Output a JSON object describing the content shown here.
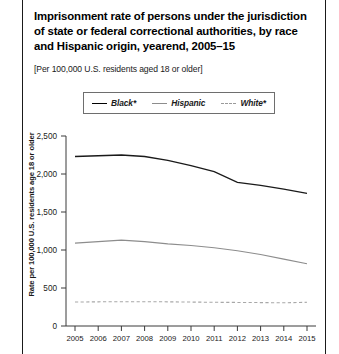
{
  "figure": {
    "title": "Imprisonment rate of persons under the jurisdiction of state or federal correctional authorities, by race and Hispanic origin, yearend, 2005–15",
    "subtitle": "[Per 100,000 U.S. residents aged 18 or older]"
  },
  "legend": {
    "items": [
      {
        "label": "Black*",
        "style": "solid-thick",
        "color": "#1a1a1a"
      },
      {
        "label": "Hispanic",
        "style": "solid-thin",
        "color": "#8d8d8d"
      },
      {
        "label": "White*",
        "style": "dashed",
        "color": "#a8a8a8"
      }
    ]
  },
  "axes": {
    "ylabel": "Rate per 100,000 U.S. residents age 18 or older",
    "yticks": [
      "0",
      "500",
      "1,000",
      "1,500",
      "2,000",
      "2,500"
    ],
    "xticks": [
      "2005",
      "2006",
      "2007",
      "2008",
      "2009",
      "2010",
      "2011",
      "2012",
      "2013",
      "2014",
      "2015"
    ]
  },
  "chart_data": {
    "type": "line",
    "title": "Imprisonment rate of persons under the jurisdiction of state or federal correctional authorities, by race and Hispanic origin, yearend, 2005–15",
    "subtitle": "[Per 100,000 U.S. residents aged 18 or older]",
    "xlabel": "",
    "ylabel": "Rate per 100,000 U.S. residents age 18 or older",
    "x": [
      2005,
      2006,
      2007,
      2008,
      2009,
      2010,
      2011,
      2012,
      2013,
      2014,
      2015
    ],
    "ylim": [
      0,
      2500
    ],
    "xlim": [
      2005,
      2015
    ],
    "grid": false,
    "legend_position": "top-center",
    "series": [
      {
        "name": "Black*",
        "color": "#1a1a1a",
        "style": "solid",
        "values": [
          2230,
          2240,
          2250,
          2230,
          2180,
          2110,
          2030,
          1890,
          1850,
          1800,
          1745
        ]
      },
      {
        "name": "Hispanic",
        "color": "#8d8d8d",
        "style": "solid",
        "values": [
          1090,
          1110,
          1130,
          1110,
          1080,
          1060,
          1030,
          990,
          940,
          880,
          820
        ]
      },
      {
        "name": "White*",
        "color": "#a8a8a8",
        "style": "dashed",
        "values": [
          315,
          318,
          320,
          320,
          318,
          315,
          312,
          310,
          308,
          305,
          312
        ]
      }
    ]
  }
}
